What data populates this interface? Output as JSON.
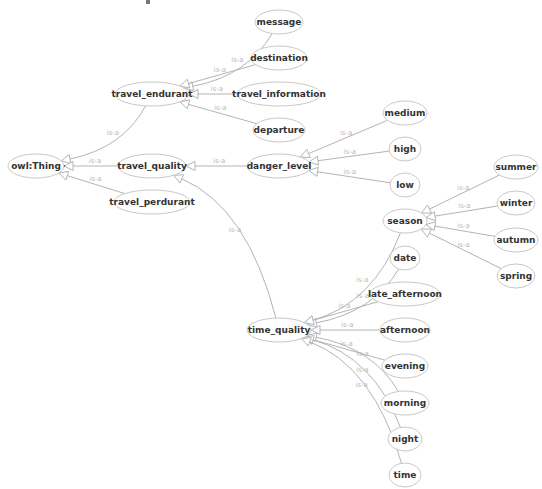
{
  "diagram": {
    "type": "ontology-class-hierarchy",
    "edge_label": "is-a",
    "colors": {
      "edge": "#b4b4b4",
      "node_border": "#c8c8c8",
      "node_text": "#333333",
      "edge_text": "#b8b8b8",
      "background": "#ffffff"
    },
    "nodes": [
      {
        "id": "owl_thing",
        "label": "owl:Thing",
        "cx": 36,
        "cy": 166,
        "rx": 28,
        "ry": 12
      },
      {
        "id": "travel_endurant",
        "label": "travel_endurant",
        "cx": 152,
        "cy": 94,
        "rx": 37,
        "ry": 12
      },
      {
        "id": "travel_quality",
        "label": "travel_quality",
        "cx": 152,
        "cy": 166,
        "rx": 34,
        "ry": 12
      },
      {
        "id": "travel_perdurant",
        "label": "travel_perdurant",
        "cx": 152,
        "cy": 202,
        "rx": 38,
        "ry": 12
      },
      {
        "id": "message",
        "label": "message",
        "cx": 279,
        "cy": 22,
        "rx": 24,
        "ry": 12
      },
      {
        "id": "destination",
        "label": "destination",
        "cx": 279,
        "cy": 58,
        "rx": 28,
        "ry": 12
      },
      {
        "id": "travel_information",
        "label": "travel_information",
        "cx": 279,
        "cy": 94,
        "rx": 42,
        "ry": 12
      },
      {
        "id": "departure",
        "label": "departure",
        "cx": 279,
        "cy": 130,
        "rx": 26,
        "ry": 12
      },
      {
        "id": "danger_level",
        "label": "danger_level",
        "cx": 279,
        "cy": 166,
        "rx": 32,
        "ry": 12
      },
      {
        "id": "medium",
        "label": "medium",
        "cx": 405,
        "cy": 113,
        "rx": 22,
        "ry": 12
      },
      {
        "id": "high",
        "label": "high",
        "cx": 405,
        "cy": 149,
        "rx": 16,
        "ry": 12
      },
      {
        "id": "low",
        "label": "low",
        "cx": 405,
        "cy": 185,
        "rx": 15,
        "ry": 12
      },
      {
        "id": "season",
        "label": "season",
        "cx": 405,
        "cy": 221,
        "rx": 22,
        "ry": 12
      },
      {
        "id": "summer",
        "label": "summer",
        "cx": 516,
        "cy": 167,
        "rx": 22,
        "ry": 12
      },
      {
        "id": "winter",
        "label": "winter",
        "cx": 516,
        "cy": 203,
        "rx": 19,
        "ry": 12
      },
      {
        "id": "autumn",
        "label": "autumn",
        "cx": 516,
        "cy": 240,
        "rx": 22,
        "ry": 12
      },
      {
        "id": "spring",
        "label": "spring",
        "cx": 516,
        "cy": 276,
        "rx": 19,
        "ry": 12
      },
      {
        "id": "date",
        "label": "date",
        "cx": 405,
        "cy": 258,
        "rx": 15,
        "ry": 12
      },
      {
        "id": "late_afternoon",
        "label": "late_afternoon",
        "cx": 405,
        "cy": 294,
        "rx": 35,
        "ry": 12
      },
      {
        "id": "time_quality",
        "label": "time_quality",
        "cx": 279,
        "cy": 330,
        "rx": 32,
        "ry": 12
      },
      {
        "id": "afternoon",
        "label": "afternoon",
        "cx": 405,
        "cy": 330,
        "rx": 25,
        "ry": 12
      },
      {
        "id": "evening",
        "label": "evening",
        "cx": 405,
        "cy": 366,
        "rx": 23,
        "ry": 12
      },
      {
        "id": "morning",
        "label": "morning",
        "cx": 405,
        "cy": 403,
        "rx": 24,
        "ry": 12
      },
      {
        "id": "night",
        "label": "night",
        "cx": 405,
        "cy": 439,
        "rx": 17,
        "ry": 12
      },
      {
        "id": "time",
        "label": "time",
        "cx": 405,
        "cy": 475,
        "rx": 16,
        "ry": 12
      }
    ],
    "edges": [
      {
        "from": "travel_endurant",
        "to": "owl_thing",
        "label": "is-a"
      },
      {
        "from": "travel_quality",
        "to": "owl_thing",
        "label": "is-a"
      },
      {
        "from": "travel_perdurant",
        "to": "owl_thing",
        "label": "is-a"
      },
      {
        "from": "message",
        "to": "travel_endurant",
        "label": "is-a"
      },
      {
        "from": "destination",
        "to": "travel_endurant",
        "label": "is-a"
      },
      {
        "from": "travel_information",
        "to": "travel_endurant",
        "label": "is-a"
      },
      {
        "from": "departure",
        "to": "travel_endurant",
        "label": "is-a"
      },
      {
        "from": "danger_level",
        "to": "travel_quality",
        "label": "is-a"
      },
      {
        "from": "time_quality",
        "to": "travel_quality",
        "label": "is-a"
      },
      {
        "from": "medium",
        "to": "danger_level",
        "label": "is-a"
      },
      {
        "from": "high",
        "to": "danger_level",
        "label": "is-a"
      },
      {
        "from": "low",
        "to": "danger_level",
        "label": "is-a"
      },
      {
        "from": "summer",
        "to": "season",
        "label": "is-a"
      },
      {
        "from": "winter",
        "to": "season",
        "label": "is-a"
      },
      {
        "from": "autumn",
        "to": "season",
        "label": "is-a"
      },
      {
        "from": "spring",
        "to": "season",
        "label": "is-a"
      },
      {
        "from": "season",
        "to": "time_quality",
        "label": "is-a"
      },
      {
        "from": "date",
        "to": "time_quality",
        "label": "is-a"
      },
      {
        "from": "late_afternoon",
        "to": "time_quality",
        "label": "is-a"
      },
      {
        "from": "afternoon",
        "to": "time_quality",
        "label": "is-a"
      },
      {
        "from": "evening",
        "to": "time_quality",
        "label": "is-a"
      },
      {
        "from": "morning",
        "to": "time_quality",
        "label": "is-a"
      },
      {
        "from": "night",
        "to": "time_quality",
        "label": "is-a"
      },
      {
        "from": "time",
        "to": "time_quality",
        "label": "is-a"
      }
    ]
  }
}
